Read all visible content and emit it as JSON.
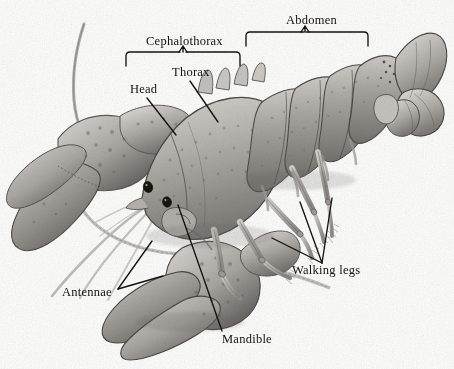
{
  "figure": {
    "background_color": "#fdfdfc",
    "ink_color": "#14110f",
    "medium": "graphite pencil illustration"
  },
  "labels": {
    "abdomen": "Abdomen",
    "cephalothorax": "Cephalothorax",
    "thorax": "Thorax",
    "head": "Head",
    "walking_legs": "Walking legs",
    "antennae": "Antennae",
    "mandible": "Mandible"
  },
  "annotations": [
    {
      "name": "abdomen",
      "text": "Abdomen",
      "type": "bracket",
      "label_x": 286,
      "label_y": 14
    },
    {
      "name": "cephalothorax",
      "text": "Cephalothorax",
      "type": "bracket",
      "label_x": 146,
      "label_y": 35
    },
    {
      "name": "thorax",
      "text": "Thorax",
      "type": "leader-line",
      "label_x": 172,
      "label_y": 67
    },
    {
      "name": "head",
      "text": "Head",
      "type": "leader-line",
      "label_x": 130,
      "label_y": 84
    },
    {
      "name": "walking-legs",
      "text": "Walking legs",
      "type": "multi-leader",
      "label_x": 292,
      "label_y": 265
    },
    {
      "name": "antennae",
      "text": "Antennae",
      "type": "multi-leader",
      "label_x": 62,
      "label_y": 287
    },
    {
      "name": "mandible",
      "text": "Mandible",
      "type": "leader-line",
      "label_x": 222,
      "label_y": 334
    }
  ],
  "anatomy_parts": [
    "abdomen",
    "cephalothorax",
    "thorax",
    "head",
    "walking legs",
    "antennae",
    "mandible",
    "tail fan",
    "cheliped claws",
    "antennules",
    "eye"
  ]
}
